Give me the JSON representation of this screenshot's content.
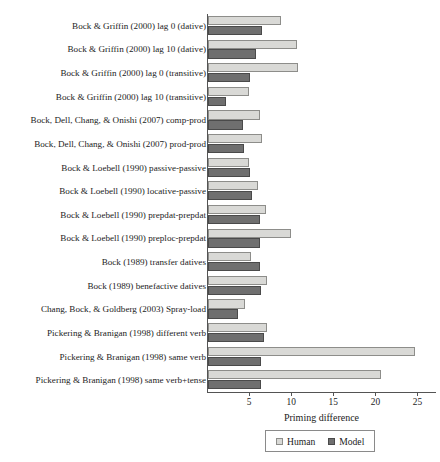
{
  "chart_data": {
    "type": "bar",
    "orientation": "horizontal",
    "title": "",
    "xlabel": "Priming difference",
    "ylabel": "",
    "xlim": [
      0,
      27.2
    ],
    "xticks": [
      5,
      10,
      15,
      20,
      25
    ],
    "grid": false,
    "legend_position": "bottom",
    "categories": [
      "Bock & Griffin (2000) lag 0 (dative)",
      "Bock & Griffin (2000) lag 10 (dative)",
      "Bock & Griffin (2000) lag 0 (transitive)",
      "Bock & Griffin (2000) lag 10 (transitive)",
      "Bock, Dell, Chang, & Onishi (2007) comp-prod",
      "Bock, Dell, Chang, & Onishi (2007) prod-prod",
      "Bock & Loebell (1990) passive-passive",
      "Bock & Loebell (1990) locative-passive",
      "Bock & Loebell (1990) prepdat-prepdat",
      "Bock & Loebell (1990) preploc-prepdat",
      "Bock (1989) transfer datives",
      "Bock (1989) benefactive datives",
      "Chang, Bock, & Goldberg (2003) Spray-load",
      "Pickering & Branigan (1998) different verb",
      "Pickering & Branigan (1998) same verb",
      "Pickering & Branigan (1998) same verb+tense"
    ],
    "series": [
      {
        "name": "Human",
        "color": "#d9d9d6",
        "values": [
          8.7,
          10.6,
          10.7,
          4.9,
          6.2,
          6.4,
          4.9,
          5.9,
          6.9,
          9.8,
          5.1,
          7.0,
          4.4,
          7.0,
          24.6,
          20.6
        ]
      },
      {
        "name": "Model",
        "color": "#6f6f6f",
        "values": [
          6.4,
          5.7,
          5.0,
          2.1,
          4.2,
          4.3,
          5.0,
          5.2,
          6.2,
          6.2,
          6.2,
          6.3,
          3.6,
          6.6,
          6.3,
          6.3
        ]
      }
    ]
  },
  "legend": {
    "items": [
      {
        "label": "Human"
      },
      {
        "label": "Model"
      }
    ]
  }
}
